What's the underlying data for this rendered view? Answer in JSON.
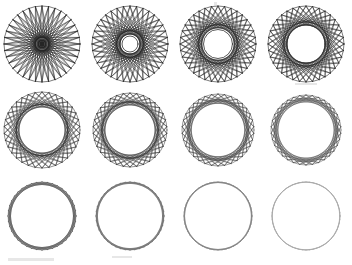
{
  "figure": {
    "background_color": "#ffffff",
    "ink_color": "#1a1a1a",
    "width": 352,
    "height": 265,
    "rows": 3,
    "columns": 4,
    "cell_width": 88,
    "cell_height": 88,
    "row_tops": [
      0,
      88,
      176
    ],
    "column_lefts": [
      0,
      88,
      176,
      264
    ]
  },
  "chart_data": {
    "type": "scatter",
    "subtitle": "Circle with N equally spaced points joined by chords of step k; inner caustic radius r = R*cos(pi*k/N)",
    "xlabel": "",
    "ylabel": "",
    "grid": false,
    "legend": null,
    "panel_count": 12,
    "panels": [
      {
        "index": 1,
        "row": 1,
        "column": 1,
        "center": [
          42,
          44
        ],
        "outer_radius": 38,
        "points": 36,
        "step": 17,
        "inner_radius": 1.7,
        "stroke_width": 0.55,
        "opacity": 0.95,
        "label": ""
      },
      {
        "index": 2,
        "row": 1,
        "column": 2,
        "center": [
          130,
          44
        ],
        "outer_radius": 38,
        "points": 36,
        "step": 15,
        "inner_radius": 8.0,
        "stroke_width": 0.55,
        "opacity": 0.95,
        "label": ""
      },
      {
        "index": 3,
        "row": 1,
        "column": 3,
        "center": [
          218,
          44
        ],
        "outer_radius": 38,
        "points": 36,
        "step": 13,
        "inner_radius": 14.5,
        "stroke_width": 0.55,
        "opacity": 0.95,
        "label": ""
      },
      {
        "index": 4,
        "row": 1,
        "column": 4,
        "center": [
          306,
          44
        ],
        "outer_radius": 38,
        "points": 36,
        "step": 12,
        "inner_radius": 19.0,
        "stroke_width": 0.55,
        "opacity": 0.95,
        "label": ""
      },
      {
        "index": 5,
        "row": 2,
        "column": 1,
        "center": [
          42,
          130
        ],
        "outer_radius": 38,
        "points": 34,
        "step": 10,
        "inner_radius": 25.5,
        "stroke_width": 0.5,
        "opacity": 0.9,
        "label": ""
      },
      {
        "index": 6,
        "row": 2,
        "column": 2,
        "center": [
          130,
          130
        ],
        "outer_radius": 37,
        "points": 34,
        "step": 9,
        "inner_radius": 28.5,
        "stroke_width": 0.5,
        "opacity": 0.88,
        "label": ""
      },
      {
        "index": 7,
        "row": 2,
        "column": 3,
        "center": [
          218,
          130
        ],
        "outer_radius": 36,
        "points": 34,
        "step": 8,
        "inner_radius": 30.5,
        "stroke_width": 0.48,
        "opacity": 0.82,
        "label": ""
      },
      {
        "index": 8,
        "row": 2,
        "column": 4,
        "center": [
          306,
          130
        ],
        "outer_radius": 35,
        "points": 34,
        "step": 7,
        "inner_radius": 31.8,
        "stroke_width": 0.46,
        "opacity": 0.78,
        "label": ""
      },
      {
        "index": 9,
        "row": 3,
        "column": 1,
        "center": [
          42,
          216
        ],
        "outer_radius": 34,
        "points": 40,
        "step": 5,
        "inner_radius": 31.5,
        "stroke_width": 0.45,
        "opacity": 0.72,
        "label": ""
      },
      {
        "index": 10,
        "row": 3,
        "column": 2,
        "center": [
          130,
          216
        ],
        "outer_radius": 34,
        "points": 44,
        "step": 4,
        "inner_radius": 32.6,
        "stroke_width": 0.42,
        "opacity": 0.64,
        "label": ""
      },
      {
        "index": 11,
        "row": 3,
        "column": 3,
        "center": [
          218,
          216
        ],
        "outer_radius": 34,
        "points": 52,
        "step": 3,
        "inner_radius": 33.4,
        "stroke_width": 0.4,
        "opacity": 0.55,
        "label": ""
      },
      {
        "index": 12,
        "row": 3,
        "column": 4,
        "center": [
          306,
          216
        ],
        "outer_radius": 34,
        "points": 60,
        "step": 2,
        "inner_radius": 33.8,
        "stroke_width": 0.38,
        "opacity": 0.4,
        "label": ""
      }
    ]
  },
  "artifacts": [
    {
      "name": "scan-speck-top",
      "x": 214,
      "y": 2,
      "width": 3,
      "height": 4
    },
    {
      "name": "scan-smudge-bottom-left",
      "x": 8,
      "y": 258,
      "width": 46,
      "height": 3
    },
    {
      "name": "scan-smudge-bottom-mid",
      "x": 112,
      "y": 256,
      "width": 20,
      "height": 2
    },
    {
      "name": "scan-smudge-row1-edge",
      "x": 295,
      "y": 83,
      "width": 22,
      "height": 2
    }
  ]
}
